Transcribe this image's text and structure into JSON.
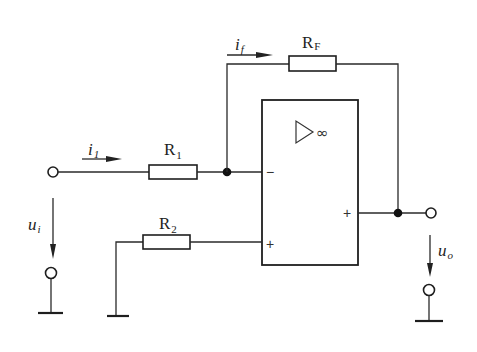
{
  "diagram": {
    "type": "inverting-op-amp-circuit",
    "components": {
      "R1": {
        "name": "R",
        "sub": "1"
      },
      "R2": {
        "name": "R",
        "sub": "2"
      },
      "RF": {
        "name": "R",
        "sub": "F"
      }
    },
    "currents": {
      "i1": {
        "name": "i",
        "sub": "1"
      },
      "if": {
        "name": "i",
        "sub": "f"
      }
    },
    "voltages": {
      "ui": {
        "name": "u",
        "sub": "i"
      },
      "uo": {
        "name": "u",
        "sub": "o"
      }
    },
    "opamp": {
      "gain_symbol": "∞",
      "inverting_sign": "−",
      "noninverting_sign": "+",
      "output_sign": "+"
    }
  }
}
